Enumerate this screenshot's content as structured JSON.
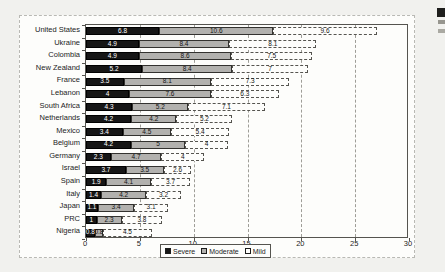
{
  "figure": {
    "x_tick_labels": [
      "0",
      "5",
      "10",
      "15",
      "20",
      "25",
      "30"
    ]
  },
  "chart_data": {
    "type": "bar",
    "orientation": "horizontal",
    "stacked": true,
    "title": "",
    "xlabel": "",
    "ylabel": "",
    "xlim": [
      0,
      30
    ],
    "xticks": [
      0,
      5,
      10,
      15,
      20,
      25,
      30
    ],
    "grid": "vertical-dashed",
    "legend_position": "bottom-center",
    "categories": [
      "United States",
      "Ukraine",
      "Colombia",
      "New Zealand",
      "France",
      "Lebanon",
      "South Africa",
      "Netherlands",
      "Mexico",
      "Belgium",
      "Germany",
      "Israel",
      "Spain",
      "Italy",
      "Japan",
      "PRC",
      "Nigeria"
    ],
    "series": [
      {
        "name": "Severe",
        "color": "#161616",
        "text_color": "#ffffff",
        "values": [
          6.8,
          4.9,
          4.9,
          5.2,
          3.5,
          4,
          4.3,
          4.2,
          3.4,
          4.2,
          2.3,
          3.7,
          1.9,
          1.4,
          1.1,
          1,
          0.8
        ],
        "labels": [
          "6.8",
          "4.9",
          "4.9",
          "5.2",
          "3.5",
          "4",
          "4.3",
          "4.2",
          "3.4",
          "4.2",
          "2.3",
          "3.7",
          "1.9",
          "1.4",
          "1.1",
          "1",
          "0.8"
        ]
      },
      {
        "name": "Moderate",
        "color": "#b2b1ae",
        "text_color": "#151515",
        "values": [
          10.6,
          8.4,
          8.6,
          8.4,
          8.1,
          7.6,
          5.2,
          4.2,
          4.5,
          5,
          4.7,
          3.5,
          4.1,
          4.2,
          3.4,
          2.3,
          0.8
        ],
        "labels": [
          "10.6",
          "8.4",
          "8.6",
          "8.4",
          "8.1",
          "7.6",
          "5.2",
          "4.2",
          "4.5",
          "5",
          "4.7",
          "3.5",
          "4.1",
          "4.2",
          "3.4",
          "2.3",
          "0.8"
        ]
      },
      {
        "name": "Mild",
        "color": "#fdfdfb",
        "text_color": "#151515",
        "values": [
          9.6,
          8.1,
          7.5,
          7,
          7.3,
          6.3,
          7.1,
          5.2,
          5.4,
          4,
          4,
          2.6,
          3.7,
          3.2,
          3.1,
          3.8,
          4.5
        ],
        "labels": [
          "9.6",
          "8.1",
          "7.5",
          "7",
          "7.3",
          "6.3",
          "7.1",
          "5.2",
          "5.4",
          "4",
          "4",
          "2.6",
          "3.7",
          "3.2",
          "3.1",
          "3.8",
          "4.5"
        ]
      }
    ],
    "legend": [
      {
        "label": "Severe",
        "swatch": "#161616"
      },
      {
        "label": "Moderate",
        "swatch": "#b2b1ae"
      },
      {
        "label": "Mild",
        "swatch": "#fdfdfb"
      }
    ]
  }
}
